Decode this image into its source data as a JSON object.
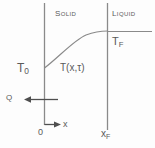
{
  "diagram": {
    "background_color": "#fdfdfd",
    "line_color": "#8a8a8a",
    "text_color": "#5a5a5a",
    "regions": {
      "solid_label": "Solid",
      "liquid_label": "Liquid"
    },
    "labels": {
      "t_fusion": "T",
      "t_fusion_sub": "F",
      "t_initial": "T",
      "t_initial_sub": "0",
      "temperature_function": "T(x,τ)",
      "heat_flux": "Q",
      "origin": "0",
      "x_axis": "x",
      "x_front": "x",
      "x_front_sub": "F"
    },
    "geometry": {
      "left_boundary_x": 44,
      "right_boundary_x": 107,
      "boundary_top_y": 3,
      "left_boundary_bottom_y": 125,
      "right_boundary_bottom_y": 130,
      "curve_start": [
        44,
        68
      ],
      "curve_end": [
        107,
        31
      ],
      "isotherm_y": 31,
      "isotherm_right_x": 152,
      "heat_arrow_y": 99,
      "heat_arrow_from_x": 58,
      "heat_arrow_to_x": 24,
      "x_arrow_y": 124,
      "x_arrow_to_x": 61
    }
  }
}
